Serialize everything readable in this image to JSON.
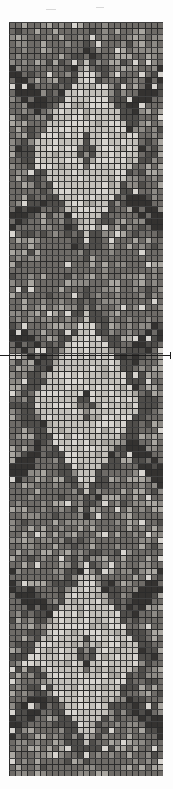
{
  "figure": {
    "title": "",
    "caption": "",
    "background_color": "#fdfdfd"
  },
  "plate": {
    "name": "pixel-mosaic-plate",
    "description": "Vertical grayscale pixel grid with repeating diamond lattice motifs",
    "x": 9,
    "y": 22,
    "width": 154,
    "height": 754,
    "columns": 25,
    "rows": 123,
    "cell_size_px": 6.16,
    "gridline_color": "#2b2b2b",
    "gridline_width_px": 1,
    "tone_palette": {
      "lightest": "#d7d4cf",
      "light": "#c2bfb9",
      "mid_light": "#a9a6a0",
      "mid": "#8d8a85",
      "mid_dark": "#6e6b67",
      "dark": "#4f4d4a",
      "darkest": "#343230"
    }
  },
  "annotation": {
    "horizontal_rule": {
      "label": "horizontal-reference-line",
      "y": 355,
      "x_start": 0,
      "x_end": 170,
      "color": "#1c1c1c",
      "thickness_px": 1,
      "end_tick": true
    }
  },
  "chart_data": {
    "type": "heatmap",
    "title": "",
    "xlabel": "",
    "ylabel": "",
    "columns": 25,
    "rows": 123,
    "value_range": [
      0,
      6
    ],
    "grid": true,
    "legend": "none",
    "colorscale": [
      "#d7d4cf",
      "#c2bfb9",
      "#a9a6a0",
      "#8d8a85",
      "#6e6b67",
      "#4f4d4a",
      "#343230"
    ],
    "motif": {
      "name": "diamond-lattice",
      "repeat_rows": 41,
      "repeats": 3,
      "centers_y_rows": [
        22,
        63,
        104
      ],
      "center_dot": true,
      "outline_tone": 5,
      "interior_tone": 1,
      "field_tone": 4
    }
  }
}
